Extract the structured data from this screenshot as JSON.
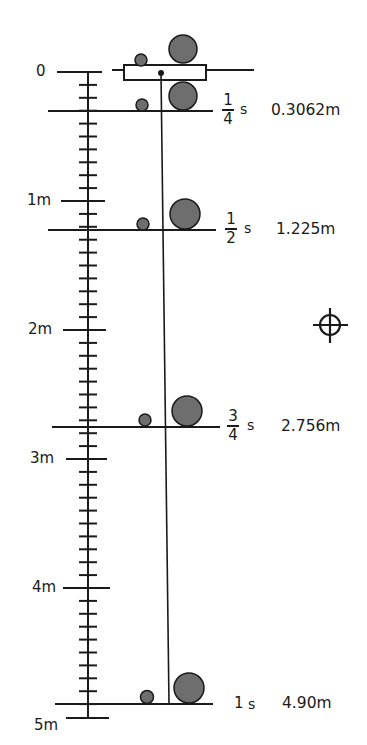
{
  "diagram": {
    "colors": {
      "ink": "#1a1a1a",
      "ball_fill": "#6e6e6e",
      "background": "#ffffff"
    },
    "scale": {
      "origin_label": "0",
      "meter_labels": [
        "1m",
        "2m",
        "3m",
        "4m",
        "5m"
      ],
      "divisions_per_meter": 10
    },
    "time_marks": [
      {
        "num": "1",
        "den": "4",
        "unit": "s",
        "distance": "0.3062m"
      },
      {
        "num": "1",
        "den": "2",
        "unit": "s",
        "distance": "1.225m"
      },
      {
        "num": "3",
        "den": "4",
        "unit": "s",
        "distance": "2.756m"
      },
      {
        "whole": "1",
        "unit": "s",
        "distance": "4.90m"
      }
    ],
    "icons": {
      "crosshair": "crosshair-icon"
    }
  }
}
